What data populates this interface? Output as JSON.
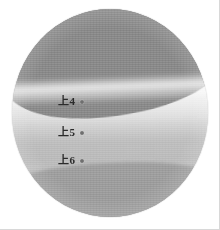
{
  "figure": {
    "type": "grayscale-circular-scan",
    "shape": "circle",
    "background_color": "#ffffff",
    "frame_color": "#d8d8d8",
    "disc": {
      "rim_color": "#f2f2f2",
      "left": 12,
      "top": 9,
      "width": 196,
      "height": 208
    },
    "regions": [
      {
        "name": "upper-dark-region",
        "color": "#8b8b8b",
        "description": "dark grey upper region with curved lower boundary"
      },
      {
        "name": "bright-echo-band",
        "color": "#f3f3f3",
        "description": "bright horizontal echo band beneath the dark region"
      },
      {
        "name": "mid-gray-band",
        "color": "#cfcfcf",
        "description": "mid grey gradient layer"
      },
      {
        "name": "lower-dark-band",
        "color": "#9d9d9d",
        "description": "darker lower band with wavy upper boundary"
      }
    ]
  },
  "annotations": [
    {
      "label": "上4",
      "marker": "dot",
      "marker_color": "#6f6f6f",
      "x": 58,
      "y": 96
    },
    {
      "label": "上5",
      "marker": "dot",
      "marker_color": "#6f6f6f",
      "x": 58,
      "y": 127
    },
    {
      "label": "上6",
      "marker": "dot",
      "marker_color": "#6f6f6f",
      "x": 58,
      "y": 155
    }
  ]
}
